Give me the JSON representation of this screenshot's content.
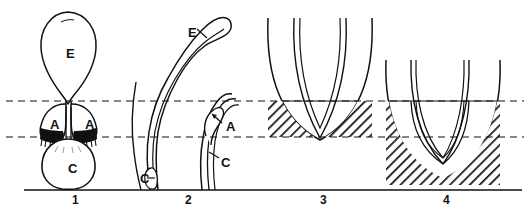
{
  "figure": {
    "title": "",
    "background_color": "#ffffff",
    "ink_color": "#111111",
    "width": 530,
    "height": 210,
    "reference_lines": {
      "style": "dashed",
      "upper_y": 101,
      "lower_y": 137,
      "baseline_y": 190
    },
    "panels": [
      {
        "number": "1",
        "number_x": 72,
        "labels": [
          {
            "text": "E",
            "x": 66,
            "y": 47,
            "name": "panel1-label-e"
          },
          {
            "text": "A",
            "x": 50,
            "y": 118,
            "name": "panel1-label-a-left"
          },
          {
            "text": "A",
            "x": 85,
            "y": 118,
            "name": "panel1-label-a-right"
          },
          {
            "text": "C",
            "x": 68,
            "y": 162,
            "name": "panel1-label-c"
          }
        ]
      },
      {
        "number": "2",
        "number_x": 185,
        "labels": [
          {
            "text": "E",
            "x": 188,
            "y": 26,
            "name": "panel2-label-e"
          },
          {
            "text": "A",
            "x": 226,
            "y": 120,
            "name": "panel2-label-a"
          },
          {
            "text": "C",
            "x": 221,
            "y": 156,
            "name": "panel2-label-c-right"
          },
          {
            "text": "C",
            "x": 140,
            "y": 172,
            "name": "panel2-label-c-left"
          }
        ]
      },
      {
        "number": "3",
        "number_x": 320,
        "labels": []
      },
      {
        "number": "4",
        "number_x": 443,
        "labels": []
      }
    ],
    "legend_keys": [
      {
        "symbol": "E",
        "name": "key-e"
      },
      {
        "symbol": "A",
        "name": "key-a"
      },
      {
        "symbol": "C",
        "name": "key-c"
      }
    ]
  }
}
